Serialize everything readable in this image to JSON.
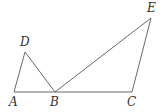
{
  "diagram": {
    "points": [
      {
        "id": "A",
        "label": "A"
      },
      {
        "id": "B",
        "label": "B"
      },
      {
        "id": "C",
        "label": "C"
      },
      {
        "id": "D",
        "label": "D"
      },
      {
        "id": "E",
        "label": "E"
      }
    ],
    "segments": [
      [
        "A",
        "B"
      ],
      [
        "B",
        "C"
      ],
      [
        "A",
        "D"
      ],
      [
        "D",
        "B"
      ],
      [
        "B",
        "E"
      ],
      [
        "E",
        "C"
      ]
    ]
  }
}
